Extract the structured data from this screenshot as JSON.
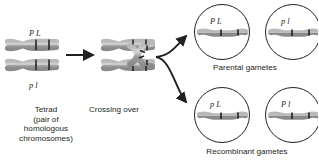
{
  "figure": {
    "background_color": "#ffffff",
    "chromatid_color": "#9a9a9a",
    "chromatid_outline": "#6f6f6f",
    "band_color": "#231f20",
    "text_color": "#231f20"
  },
  "stages": {
    "tetrad": {
      "caption": "Tetrad\n(pair of\nhomologous\nchromosomes)",
      "alleles_top": "P  L",
      "alleles_bottom": "p  l"
    },
    "crossing_over": {
      "caption": "Crossing over"
    }
  },
  "gametes": {
    "parental": {
      "caption": "Parental gametes",
      "cells": [
        {
          "alleles": "P  L",
          "allele_left": "P",
          "allele_right": "L"
        },
        {
          "alleles": "p  l",
          "allele_left": "p",
          "allele_right": "l"
        }
      ]
    },
    "recombinant": {
      "caption": "Recombinant gametes",
      "cells": [
        {
          "alleles": "p  L",
          "allele_left": "p",
          "allele_right": "L"
        },
        {
          "alleles": "P  l",
          "allele_left": "P",
          "allele_right": "l"
        }
      ]
    }
  },
  "arrows": {
    "straight": "arrow-right",
    "branch_up": "arrow-curve-up",
    "branch_down": "arrow-curve-down"
  }
}
